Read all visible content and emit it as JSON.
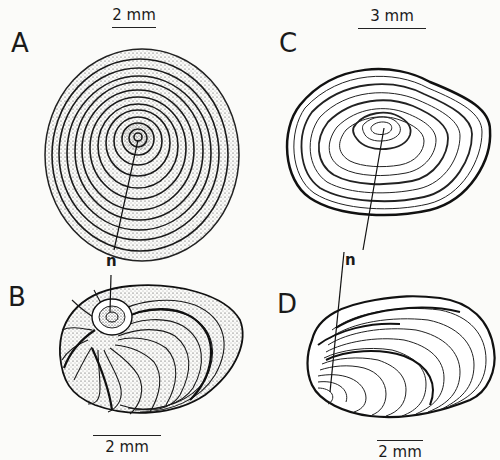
{
  "figure": {
    "panels": [
      {
        "id": "A",
        "label": "A",
        "scale": "2 mm",
        "description": "circular multispiral operculum"
      },
      {
        "id": "B",
        "label": "B",
        "scale": "2 mm",
        "description": "oval shell with spiral growth"
      },
      {
        "id": "C",
        "label": "C",
        "scale": "3 mm",
        "description": "ovate concentric operculum"
      },
      {
        "id": "D",
        "label": "D",
        "scale": "2 mm",
        "description": "bivalve-like shell with growth lines"
      }
    ],
    "nucleus_label": "n",
    "colors": {
      "ink": "#1a1a1a",
      "paper": "#fbfbf9"
    }
  }
}
